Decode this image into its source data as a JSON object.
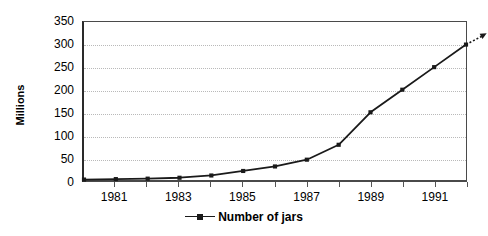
{
  "chart_data": {
    "type": "line",
    "title": "",
    "subtitle": "",
    "xlabel": "",
    "ylabel": "Millions",
    "x": [
      1980,
      1981,
      1982,
      1983,
      1984,
      1985,
      1986,
      1987,
      1988,
      1989,
      1990,
      1991,
      1992
    ],
    "categories": [
      "1980",
      "1981",
      "1982",
      "1983",
      "1984",
      "1985",
      "1986",
      "1987",
      "1988",
      "1989",
      "1990",
      "1991",
      "1992"
    ],
    "xtick_labels": [
      "1981",
      "1983",
      "1985",
      "1987",
      "1989",
      "1991"
    ],
    "xtick_label_values": [
      1981,
      1983,
      1985,
      1987,
      1989,
      1991
    ],
    "ytick_labels": [
      "0",
      "50",
      "100",
      "150",
      "200",
      "250",
      "300",
      "350"
    ],
    "ytick_values": [
      0,
      50,
      100,
      150,
      200,
      250,
      300,
      350
    ],
    "ylim": [
      0,
      350
    ],
    "xlim": [
      1980,
      1992
    ],
    "grid": true,
    "grid_axis": "y",
    "legend": [
      {
        "name": "Number of jars",
        "marker": "square",
        "color": "#1a1a1a"
      }
    ],
    "legend_position": "bottom",
    "series": [
      {
        "name": "Number of jars",
        "color": "#1a1a1a",
        "marker": "square",
        "values": [
          1,
          2,
          3,
          5,
          10,
          20,
          30,
          45,
          78,
          150,
          200,
          250,
          300
        ]
      }
    ],
    "annotations": [
      {
        "name": "projection-arrow",
        "type": "dotted-arrow",
        "from": {
          "x": 1992,
          "y": 300
        },
        "to": {
          "x": 1992.65,
          "y": 325
        },
        "style": "dotted",
        "color": "#1a1a1a"
      }
    ]
  },
  "legend_label": "Number of jars"
}
